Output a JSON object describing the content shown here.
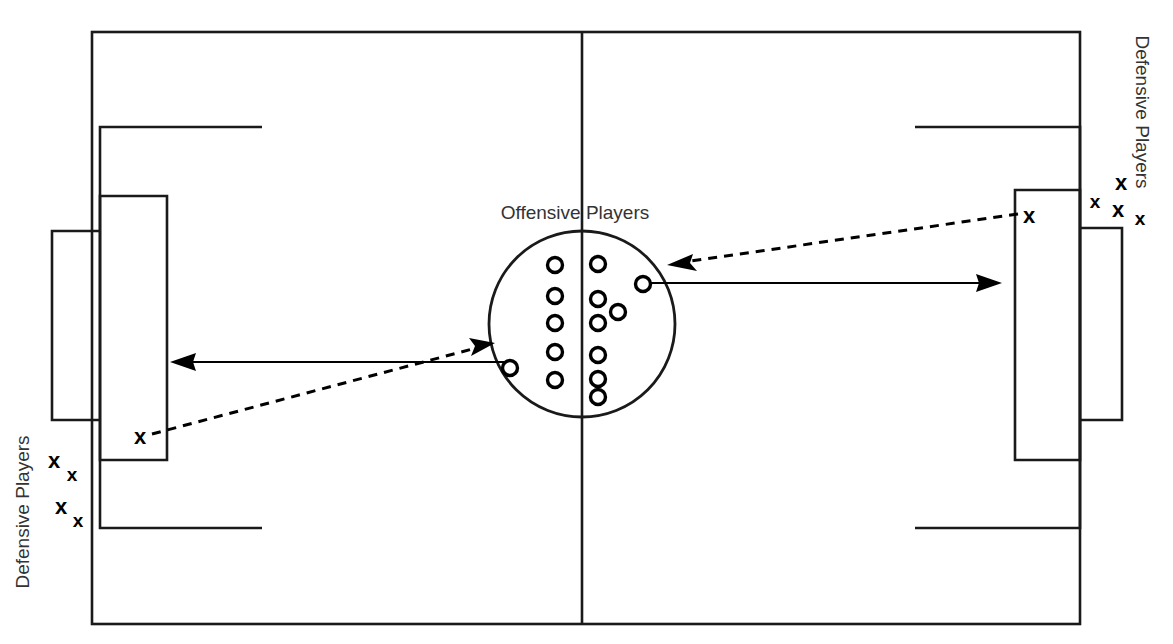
{
  "diagram": {
    "colors": {
      "line": "#1a1a1a",
      "mark": "#000000",
      "label": "#333333",
      "background": "#ffffff"
    },
    "labels": {
      "offensive": "Offensive Players",
      "defensive_left": "Defensive Players",
      "defensive_right": "Defensive Players"
    },
    "field": {
      "left": 92,
      "right": 1080,
      "top": 32,
      "bottom": 624,
      "center_line_x": 582
    },
    "center_circle": {
      "cx": 582,
      "cy": 324,
      "r": 93
    },
    "offensive_marks": {
      "glyph": "o",
      "count": 15,
      "left_column": [
        {
          "x": 555,
          "y": 265
        },
        {
          "x": 555,
          "y": 296
        },
        {
          "x": 555,
          "y": 323
        },
        {
          "x": 555,
          "y": 352
        },
        {
          "x": 555,
          "y": 380
        }
      ],
      "right_column": [
        {
          "x": 598,
          "y": 264
        },
        {
          "x": 598,
          "y": 299
        },
        {
          "x": 598,
          "y": 323
        },
        {
          "x": 598,
          "y": 355
        },
        {
          "x": 598,
          "y": 379
        },
        {
          "x": 598,
          "y": 397
        }
      ],
      "extras": [
        {
          "x": 618,
          "y": 312
        },
        {
          "x": 643,
          "y": 284
        },
        {
          "x": 510,
          "y": 368
        }
      ]
    },
    "defensive_marks": {
      "glyph": "x",
      "left_in_box": [
        {
          "x": 140,
          "y": 436,
          "size": "large"
        }
      ],
      "left_cluster": [
        {
          "x": 54,
          "y": 460,
          "size": "large"
        },
        {
          "x": 72,
          "y": 473,
          "size": "small"
        },
        {
          "x": 61,
          "y": 506,
          "size": "large"
        },
        {
          "x": 77,
          "y": 519,
          "size": "small"
        }
      ],
      "right_in_box": [
        {
          "x": 1029,
          "y": 215,
          "size": "large"
        }
      ],
      "right_cluster": [
        {
          "x": 1121,
          "y": 182,
          "size": "large"
        },
        {
          "x": 1094,
          "y": 201,
          "size": "small"
        },
        {
          "x": 1118,
          "y": 208,
          "size": "large"
        },
        {
          "x": 1139,
          "y": 217,
          "size": "small"
        }
      ]
    },
    "arrows": {
      "left_solid": {
        "x1": 505,
        "y1": 362,
        "x2": 173,
        "y2": 362,
        "direction": "left"
      },
      "right_solid": {
        "x1": 650,
        "y1": 283,
        "x2": 1000,
        "y2": 283,
        "direction": "right"
      },
      "left_dashed": {
        "x1": 152,
        "y1": 434,
        "x2": 492,
        "y2": 344,
        "direction": "up-right"
      },
      "right_dashed": {
        "x1": 1018,
        "y1": 214,
        "x2": 670,
        "y2": 264,
        "direction": "down-left"
      }
    }
  }
}
